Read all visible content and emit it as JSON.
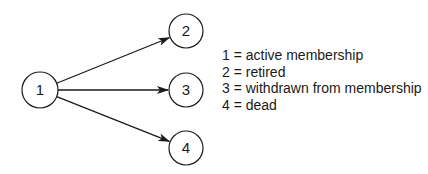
{
  "diagram": {
    "type": "state-transition",
    "nodes": [
      {
        "id": "1",
        "label": "1",
        "cx": 40,
        "cy": 90,
        "r": 18
      },
      {
        "id": "2",
        "label": "2",
        "cx": 186,
        "cy": 31,
        "r": 17
      },
      {
        "id": "3",
        "label": "3",
        "cx": 186,
        "cy": 90,
        "r": 17
      },
      {
        "id": "4",
        "label": "4",
        "cx": 186,
        "cy": 148,
        "r": 17
      }
    ],
    "edges": [
      {
        "from": "1",
        "to": "2"
      },
      {
        "from": "1",
        "to": "3"
      },
      {
        "from": "1",
        "to": "4"
      }
    ]
  },
  "legend": {
    "items": [
      {
        "text": "1 = active membership"
      },
      {
        "text": "2 = retired"
      },
      {
        "text": "3 = withdrawn from membership"
      },
      {
        "text": "4 = dead"
      }
    ]
  }
}
